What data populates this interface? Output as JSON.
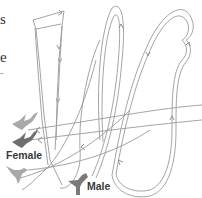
{
  "figure": {
    "type": "flight-path diagram",
    "left_edge_text_fragments": [
      "s",
      "e",
      "-"
    ],
    "labels": {
      "female": "Female",
      "male": "Male"
    },
    "icons": {
      "female_birds": [
        "hummingbird-female-light-icon",
        "hummingbird-female-dark-icon",
        "hummingbird-female-light-icon"
      ],
      "male_bird": "hummingbird-male-icon"
    },
    "colors": {
      "path_line": "#9a9a9a",
      "bird_light": "#a8a8a8",
      "bird_dark": "#6e6e6e",
      "label_text": "#3a3a3a"
    }
  }
}
